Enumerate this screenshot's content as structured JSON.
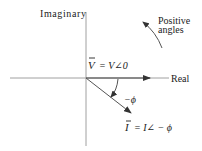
{
  "diagram": {
    "type": "phasor-diagram",
    "axes": {
      "vertical_label": "Imaginary",
      "horizontal_label": "Real"
    },
    "annotations": {
      "rotation_label_line1": "Positive",
      "rotation_label_line2": "angles",
      "angle_label": "−ϕ"
    },
    "phasors": [
      {
        "name": "V",
        "symbol": "V",
        "equation_rhs": "= V∠0",
        "angle_deg": 0
      },
      {
        "name": "I",
        "symbol": "I",
        "equation_rhs": "= I∠ − ϕ",
        "angle_deg": -38
      }
    ],
    "colors": {
      "axis": "#9a9a9a",
      "phasor": "#555555",
      "text": "#222222",
      "background": "#ffffff"
    }
  }
}
